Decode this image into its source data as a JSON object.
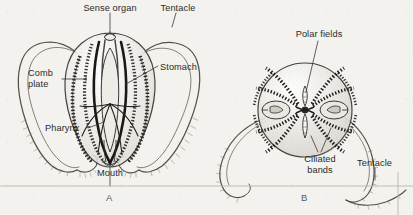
{
  "figure": {
    "caption_a": "A",
    "caption_b": "B",
    "style": {
      "ink": "#2f2d2b",
      "ink_light": "#6b6862",
      "paper": "#f3f2ee",
      "stipple": "#8a867e",
      "rule": "#b9b6ae"
    }
  },
  "panel_a": {
    "name": "Lateral view of ctenophore",
    "labels": {
      "sense_organ": "Sense organ",
      "tentacle": "Tentacle",
      "comb_plate_line1": "Comb",
      "comb_plate_line2": "plate",
      "stomach": "Stomach",
      "pharynx": "Pharynx",
      "mouth": "Mouth"
    }
  },
  "panel_b": {
    "name": "Aboral polar view of ctenophore",
    "labels": {
      "polar_fields": "Polar fields",
      "ciliated_bands_line1": "Ciliated",
      "ciliated_bands_line2": "bands",
      "tentacle": "Tentacle"
    }
  }
}
